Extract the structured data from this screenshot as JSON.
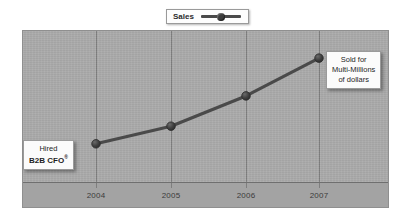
{
  "legend": {
    "label": "Sales",
    "symbol_icon": "line-marker-icon"
  },
  "annotations": {
    "left": {
      "line1": "Hired",
      "line2": "B2B CFO",
      "superscript": "®"
    },
    "right": {
      "line1": "Sold for",
      "line2": "Multi-Millions",
      "line3": "of dollars"
    }
  },
  "colors": {
    "plot_background": "#a9a9a9",
    "label_band": "#a3a3a3",
    "gridline": "#7e7e7e",
    "axis": "#6f6f6f",
    "series": "#4a4a4a",
    "marker": "#3d3d3d",
    "callout_background": "#fbfbfb",
    "callout_border": "#9a9a9a",
    "page_background": "#ffffff"
  },
  "chart_data": {
    "type": "line",
    "title": "",
    "subtitle": "",
    "xlabel": "",
    "ylabel": "",
    "categories": [
      "2004",
      "2005",
      "2006",
      "2007"
    ],
    "series": [
      {
        "name": "Sales",
        "values": [
          20,
          34,
          58,
          88
        ]
      }
    ],
    "ylim": [
      0,
      100
    ],
    "yticks_shown": false,
    "grid": "vertical-only",
    "legend_position": "top-center",
    "markers": "circle",
    "annotations": [
      {
        "at_category": "2004",
        "text": "Hired B2B CFO®",
        "position": "left-of-point"
      },
      {
        "at_category": "2007",
        "text": "Sold for Multi-Millions of dollars",
        "position": "right-of-point"
      }
    ]
  }
}
